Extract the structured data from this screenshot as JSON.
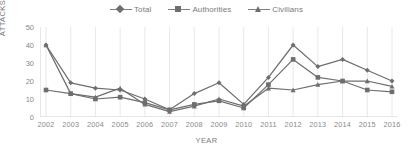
{
  "legend": {
    "position": "top-center",
    "items": [
      {
        "label": "Total",
        "marker": "diamond-marker-icon",
        "color": "#6e6e6e"
      },
      {
        "label": "Authorities",
        "marker": "square-marker-icon",
        "color": "#6e6e6e"
      },
      {
        "label": "Civilians",
        "marker": "triangle-marker-icon",
        "color": "#6e6e6e"
      }
    ]
  },
  "chart_data": {
    "type": "line",
    "title": "",
    "xlabel": "YEAR",
    "ylabel": "ATTACKS",
    "categories": [
      "2002",
      "2003",
      "2004",
      "2005",
      "2006",
      "2007",
      "2008",
      "2009",
      "2010",
      "2011",
      "2012",
      "2013",
      "2014",
      "2015",
      "2016"
    ],
    "yticks": [
      0,
      10,
      20,
      30,
      40,
      50
    ],
    "ylim": [
      0,
      50
    ],
    "grid": "vertical",
    "legend_position": "top-center",
    "series": [
      {
        "name": "Total",
        "marker": "diamond",
        "color": "#6e6e6e",
        "values": [
          40,
          19,
          16,
          15,
          10,
          4,
          13,
          19,
          7,
          22,
          40,
          28,
          32,
          26,
          20
        ]
      },
      {
        "name": "Authorities",
        "marker": "square",
        "color": "#6e6e6e",
        "values": [
          15,
          13,
          10,
          11,
          8,
          4,
          7,
          9,
          5,
          18,
          32,
          22,
          20,
          15,
          14
        ]
      },
      {
        "name": "Civilians",
        "marker": "triangle",
        "color": "#6e6e6e",
        "values": [
          40,
          13,
          11,
          16,
          7,
          3,
          6,
          10,
          6,
          16,
          15,
          18,
          20,
          20,
          17
        ]
      }
    ]
  },
  "axes": {
    "y_tick_labels": [
      "50",
      "40",
      "30",
      "20",
      "10",
      "0"
    ],
    "x_tick_labels": [
      "2002",
      "2003",
      "2004",
      "2005",
      "2006",
      "2007",
      "2008",
      "2009",
      "2010",
      "2011",
      "2012",
      "2013",
      "2014",
      "2015",
      "2016"
    ]
  }
}
